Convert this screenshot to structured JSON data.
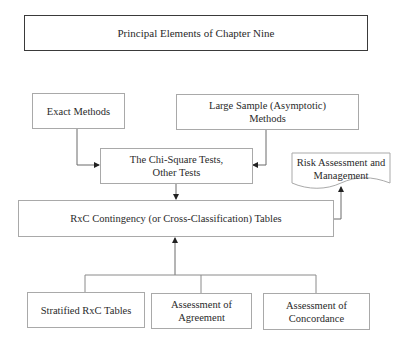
{
  "diagram": {
    "title": "Principal Elements of Chapter Nine",
    "nodes": {
      "exact_methods": "Exact Methods",
      "large_sample": {
        "line1": "Large Sample (Asymptotic)",
        "line2": "Methods"
      },
      "chi_square": {
        "line1": "The Chi-Square Tests,",
        "line2": "Other Tests"
      },
      "risk": {
        "line1": "Risk Assessment and",
        "line2": "Management"
      },
      "rxc": "RxC Contingency (or Cross-Classification) Tables",
      "stratified": "Stratified RxC Tables",
      "agreement": {
        "line1": "Assessment of",
        "line2": "Agreement"
      },
      "concordance": {
        "line1": "Assessment of",
        "line2": "Concordance"
      }
    },
    "edges": [
      {
        "from": "Exact Methods",
        "to": "The Chi-Square Tests, Other Tests"
      },
      {
        "from": "Large Sample (Asymptotic) Methods",
        "to": "The Chi-Square Tests, Other Tests"
      },
      {
        "from": "The Chi-Square Tests, Other Tests",
        "to": "RxC Contingency (or Cross-Classification) Tables"
      },
      {
        "from": "RxC Contingency (or Cross-Classification) Tables",
        "to": "Risk Assessment and Management"
      },
      {
        "from": "Stratified RxC Tables / Assessment of Agreement / Assessment of Concordance",
        "to": "RxC Contingency (or Cross-Classification) Tables"
      }
    ],
    "colors": {
      "line": "#6a6a6a",
      "border": "#a9a9a9",
      "title_border": "#3a3a3a",
      "text": "#2a2a2a"
    }
  }
}
